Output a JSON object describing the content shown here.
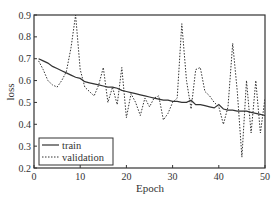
{
  "chart_data": {
    "type": "line",
    "title": "",
    "xlabel": "Epoch",
    "ylabel": "loss",
    "xlim": [
      0,
      50
    ],
    "ylim": [
      0.2,
      0.9
    ],
    "xticks": [
      0,
      10,
      20,
      30,
      40,
      50
    ],
    "yticks": [
      0.2,
      0.3,
      0.4,
      0.5,
      0.6,
      0.7,
      0.8,
      0.9
    ],
    "grid": false,
    "legend_position": "lower left",
    "x": [
      1,
      2,
      3,
      4,
      5,
      6,
      7,
      8,
      9,
      10,
      11,
      12,
      13,
      14,
      15,
      16,
      17,
      18,
      19,
      20,
      21,
      22,
      23,
      24,
      25,
      26,
      27,
      28,
      29,
      30,
      31,
      32,
      33,
      34,
      35,
      36,
      37,
      38,
      39,
      40,
      41,
      42,
      43,
      44,
      45,
      46,
      47,
      48,
      49,
      50
    ],
    "series": [
      {
        "name": "train",
        "style": "solid",
        "values": [
          0.7,
          0.69,
          0.68,
          0.665,
          0.655,
          0.645,
          0.635,
          0.625,
          0.615,
          0.61,
          0.595,
          0.59,
          0.585,
          0.58,
          0.575,
          0.57,
          0.57,
          0.565,
          0.555,
          0.55,
          0.545,
          0.54,
          0.535,
          0.53,
          0.525,
          0.52,
          0.515,
          0.51,
          0.51,
          0.505,
          0.505,
          0.5,
          0.5,
          0.51,
          0.49,
          0.49,
          0.485,
          0.48,
          0.475,
          0.49,
          0.47,
          0.465,
          0.465,
          0.46,
          0.46,
          0.46,
          0.455,
          0.45,
          0.445,
          0.44
        ]
      },
      {
        "name": "validation",
        "style": "dashed",
        "values": [
          0.69,
          0.65,
          0.6,
          0.58,
          0.57,
          0.6,
          0.64,
          0.75,
          0.9,
          0.65,
          0.57,
          0.55,
          0.53,
          0.58,
          0.66,
          0.5,
          0.57,
          0.49,
          0.66,
          0.43,
          0.54,
          0.5,
          0.44,
          0.52,
          0.48,
          0.52,
          0.53,
          0.42,
          0.45,
          0.5,
          0.52,
          0.86,
          0.6,
          0.47,
          0.65,
          0.66,
          0.55,
          0.53,
          0.5,
          0.48,
          0.4,
          0.48,
          0.77,
          0.55,
          0.25,
          0.6,
          0.36,
          0.6,
          0.36,
          0.52
        ]
      }
    ]
  },
  "legend": {
    "items": [
      {
        "label": "train"
      },
      {
        "label": "validation"
      }
    ]
  },
  "axes": {
    "xlabel": "Epoch",
    "ylabel": "loss",
    "xtick_labels": [
      "0",
      "10",
      "20",
      "30",
      "40",
      "50"
    ],
    "ytick_labels": [
      "0.2",
      "0.3",
      "0.4",
      "0.5",
      "0.6",
      "0.7",
      "0.8",
      "0.9"
    ]
  },
  "colors": {
    "axis": "#333333",
    "line": "#333333",
    "background": "#ffffff"
  }
}
